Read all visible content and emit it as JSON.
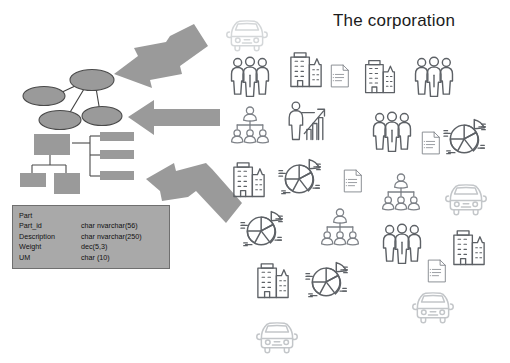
{
  "page": {
    "background_color": "#ffffff",
    "title": "The corporation"
  },
  "db_table": {
    "name": "database-table",
    "fill_color": "#a9a9a9",
    "border_color": "#6f6f6f",
    "entity": "Part",
    "columns": [
      "field",
      "type"
    ],
    "fields": [
      {
        "field": "Part_id",
        "type": "char nvarchar(56)"
      },
      {
        "field": "Description",
        "type": "char nvarchar(250)"
      },
      {
        "field": "Weight",
        "type": "dec(5,3)"
      },
      {
        "field": "UM",
        "type": "char (10)"
      }
    ]
  },
  "diagrams": {
    "network": {
      "name": "entity-network-diagram",
      "node_fill": "#9a9a9a",
      "node_stroke": "#4a4a4a",
      "node_count": 4,
      "edge_count": 3
    },
    "hierarchy": {
      "name": "hierarchy-diagram",
      "box_fill": "#9a9a9a",
      "box_count": 6
    }
  },
  "arrows": {
    "fill_color": "#9a9a9a",
    "items": [
      {
        "name": "arrow-top",
        "direction": "down-left"
      },
      {
        "name": "arrow-middle",
        "direction": "left"
      },
      {
        "name": "arrow-bottom",
        "direction": "up-left"
      }
    ]
  },
  "icon_field": {
    "name": "corporation-icon-cloud",
    "stroke_dark": "#5d6166",
    "stroke_mid": "#7e8288",
    "stroke_light": "#c3c6c9",
    "stroke_pale": "#d4d7d9",
    "icons": [
      {
        "name": "car-icon",
        "kind": "car",
        "x": 224,
        "y": 8,
        "size": 46,
        "tone": "pale"
      },
      {
        "name": "people-group-icon",
        "kind": "people",
        "x": 228,
        "y": 55,
        "size": 44,
        "tone": "dark"
      },
      {
        "name": "buildings-icon",
        "kind": "buildings",
        "x": 285,
        "y": 47,
        "size": 42,
        "tone": "dark"
      },
      {
        "name": "document-icon",
        "kind": "document",
        "x": 327,
        "y": 63,
        "size": 26,
        "tone": "mid"
      },
      {
        "name": "buildings-icon",
        "kind": "buildings",
        "x": 360,
        "y": 55,
        "size": 40,
        "tone": "dark"
      },
      {
        "name": "people-group-icon",
        "kind": "people",
        "x": 412,
        "y": 55,
        "size": 44,
        "tone": "dark"
      },
      {
        "name": "org-chart-icon",
        "kind": "orgchart",
        "x": 230,
        "y": 105,
        "size": 40,
        "tone": "mid"
      },
      {
        "name": "presenter-icon",
        "kind": "presenter",
        "x": 285,
        "y": 100,
        "size": 42,
        "tone": "dark"
      },
      {
        "name": "people-group-icon",
        "kind": "people",
        "x": 370,
        "y": 110,
        "size": 44,
        "tone": "dark"
      },
      {
        "name": "document-icon",
        "kind": "document",
        "x": 418,
        "y": 130,
        "size": 26,
        "tone": "mid"
      },
      {
        "name": "pie-chart-icon",
        "kind": "pie",
        "x": 443,
        "y": 115,
        "size": 46,
        "tone": "dark"
      },
      {
        "name": "buildings-icon",
        "kind": "buildings",
        "x": 228,
        "y": 157,
        "size": 42,
        "tone": "dark"
      },
      {
        "name": "pie-chart-icon",
        "kind": "pie",
        "x": 278,
        "y": 155,
        "size": 46,
        "tone": "dark"
      },
      {
        "name": "document-icon",
        "kind": "document",
        "x": 340,
        "y": 168,
        "size": 26,
        "tone": "mid"
      },
      {
        "name": "org-chart-icon",
        "kind": "orgchart",
        "x": 381,
        "y": 172,
        "size": 40,
        "tone": "mid"
      },
      {
        "name": "car-icon",
        "kind": "car",
        "x": 443,
        "y": 172,
        "size": 46,
        "tone": "light"
      },
      {
        "name": "pie-chart-icon",
        "kind": "pie",
        "x": 240,
        "y": 207,
        "size": 46,
        "tone": "dark"
      },
      {
        "name": "org-chart-icon",
        "kind": "orgchart",
        "x": 320,
        "y": 207,
        "size": 40,
        "tone": "mid"
      },
      {
        "name": "people-group-icon",
        "kind": "people",
        "x": 380,
        "y": 222,
        "size": 44,
        "tone": "dark"
      },
      {
        "name": "buildings-icon",
        "kind": "buildings",
        "x": 448,
        "y": 225,
        "size": 42,
        "tone": "dark"
      },
      {
        "name": "buildings-icon",
        "kind": "buildings",
        "x": 252,
        "y": 258,
        "size": 42,
        "tone": "dark"
      },
      {
        "name": "pie-chart-icon",
        "kind": "pie",
        "x": 305,
        "y": 258,
        "size": 46,
        "tone": "dark"
      },
      {
        "name": "document-icon",
        "kind": "document",
        "x": 424,
        "y": 258,
        "size": 26,
        "tone": "mid"
      },
      {
        "name": "car-icon",
        "kind": "car",
        "x": 410,
        "y": 280,
        "size": 46,
        "tone": "light"
      },
      {
        "name": "car-icon",
        "kind": "car",
        "x": 254,
        "y": 310,
        "size": 46,
        "tone": "light"
      }
    ]
  }
}
